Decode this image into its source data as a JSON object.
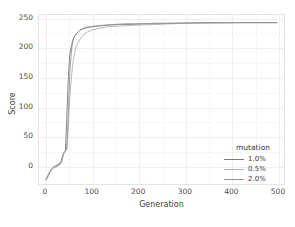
{
  "chart_data": {
    "type": "line",
    "title": "",
    "xlabel": "Generation",
    "ylabel": "Score",
    "xlim": [
      -15,
      515
    ],
    "ylim": [
      -32,
      256
    ],
    "xticks": [
      0,
      100,
      200,
      300,
      400,
      500
    ],
    "yticks": [
      0,
      50,
      100,
      150,
      200,
      250
    ],
    "grid": true,
    "legend": {
      "title": "mutation",
      "position": "inside-bottom-right",
      "entries": [
        {
          "label": "1.0%",
          "color": "#7a7a7a"
        },
        {
          "label": "0.5%",
          "color": "#b0b0b0"
        },
        {
          "label": "2.0%",
          "color": "#949494"
        }
      ]
    },
    "series": [
      {
        "name": "1.0%",
        "color": "#7a7a7a",
        "x": [
          0,
          4,
          8,
          12,
          16,
          20,
          24,
          28,
          32,
          34,
          36,
          38,
          40,
          42,
          44,
          46,
          48,
          50,
          52,
          54,
          56,
          58,
          60,
          64,
          68,
          72,
          76,
          80,
          86,
          92,
          100,
          112,
          125,
          140,
          160,
          185,
          210,
          240,
          275,
          310,
          360,
          420,
          470,
          500
        ],
        "y": [
          -25,
          -20,
          -13,
          -8,
          -5,
          -3,
          -2,
          0,
          2,
          6,
          14,
          20,
          22,
          24,
          60,
          100,
          140,
          170,
          190,
          200,
          206,
          212,
          218,
          222,
          226,
          229,
          231,
          232,
          234,
          235,
          236,
          237,
          238,
          239,
          240,
          240,
          241,
          241,
          242,
          242,
          243,
          243,
          243,
          243
        ]
      },
      {
        "name": "0.5%",
        "color": "#b0b0b0",
        "x": [
          0,
          4,
          8,
          12,
          16,
          20,
          24,
          28,
          32,
          36,
          38,
          40,
          42,
          44,
          46,
          48,
          50,
          54,
          58,
          62,
          66,
          70,
          74,
          78,
          84,
          90,
          98,
          108,
          120,
          135,
          155,
          180,
          205,
          235,
          270,
          310,
          360,
          420,
          470,
          500
        ],
        "y": [
          -25,
          -19,
          -12,
          -7,
          -4,
          -2,
          0,
          2,
          4,
          12,
          18,
          22,
          24,
          26,
          30,
          60,
          95,
          140,
          172,
          192,
          203,
          210,
          215,
          220,
          224,
          227,
          230,
          232,
          234,
          236,
          237,
          238,
          239,
          240,
          241,
          242,
          242,
          243,
          243,
          243
        ]
      },
      {
        "name": "2.0%",
        "color": "#949494",
        "x": [
          0,
          4,
          8,
          12,
          16,
          20,
          24,
          28,
          32,
          36,
          40,
          44,
          46,
          48,
          50,
          52,
          54,
          56,
          58,
          60,
          64,
          68,
          72,
          76,
          80,
          86,
          94,
          104,
          116,
          130,
          150,
          175,
          205,
          240,
          280,
          330,
          390,
          450,
          500
        ],
        "y": [
          -25,
          -18,
          -11,
          -6,
          -3,
          -1,
          1,
          3,
          6,
          15,
          23,
          26,
          40,
          80,
          125,
          160,
          185,
          200,
          210,
          216,
          222,
          226,
          229,
          231,
          233,
          235,
          236,
          237,
          238,
          239,
          240,
          241,
          241,
          242,
          242,
          243,
          243,
          243,
          243
        ]
      }
    ]
  },
  "axes": {
    "xtick_labels": [
      "0",
      "100",
      "200",
      "300",
      "400",
      "500"
    ],
    "ytick_labels": [
      "0",
      "50",
      "100",
      "150",
      "200",
      "250"
    ]
  }
}
